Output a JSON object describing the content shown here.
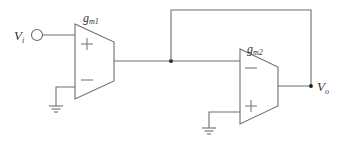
{
  "diagram": {
    "type": "circuit-schematic",
    "input": {
      "label": "V",
      "subscript": "i",
      "symbol": "voltage-source-terminal"
    },
    "output": {
      "label": "V",
      "subscript": "o"
    },
    "amplifiers": [
      {
        "id": "ota1",
        "label": "g",
        "subscript": "m1",
        "inputs": [
          {
            "terminal": "+",
            "connected_to": "Vi"
          },
          {
            "terminal": "−",
            "connected_to": "ground"
          }
        ],
        "output_connected_to": "internal-node"
      },
      {
        "id": "ota2",
        "label": "g",
        "subscript": "m2",
        "inputs": [
          {
            "terminal": "−",
            "connected_to": "internal-node"
          },
          {
            "terminal": "+",
            "connected_to": "ground"
          }
        ],
        "output_connected_to": "Vo"
      }
    ],
    "feedback": {
      "from": "Vo",
      "to": "internal-node"
    },
    "colors": {
      "wire": "#6e6e6e",
      "node": "#1a1a1a",
      "text": "#333333",
      "background": "#ffffff"
    }
  }
}
